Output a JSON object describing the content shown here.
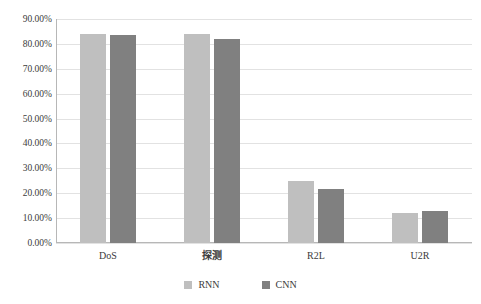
{
  "chart_data": {
    "type": "bar",
    "title": "",
    "subtitle": "",
    "xlabel": "",
    "ylabel": "",
    "categories": [
      "DoS",
      "探测",
      "R2L",
      "U2R"
    ],
    "series": [
      {
        "name": "RNN",
        "color": "#bfbfbf",
        "values": [
          84.0,
          84.0,
          25.0,
          12.0
        ]
      },
      {
        "name": "CNN",
        "color": "#808080",
        "values": [
          83.5,
          82.0,
          21.7,
          13.0
        ]
      }
    ],
    "ylim": [
      0,
      90
    ],
    "ytick_values": [
      0,
      10,
      20,
      30,
      40,
      50,
      60,
      70,
      80,
      90
    ],
    "ytick_labels": [
      "0.00%",
      "10.00%",
      "20.00%",
      "30.00%",
      "40.00%",
      "50.00%",
      "60.00%",
      "70.00%",
      "80.00%",
      "90.00%"
    ],
    "grid": true,
    "legend_position": "bottom",
    "legend_entries": [
      "RNN",
      "CNN"
    ]
  }
}
